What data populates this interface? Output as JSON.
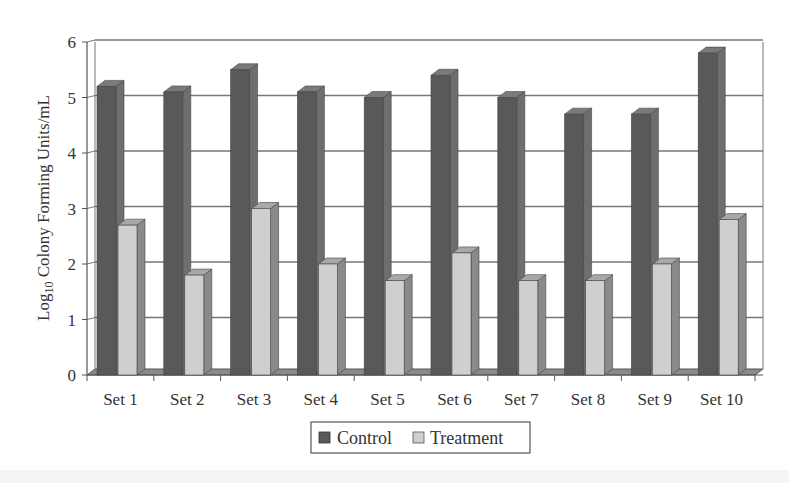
{
  "chart_data": {
    "type": "bar",
    "style": "3d-clustered-column",
    "title": "",
    "xlabel": "",
    "ylabel": "Log10 Colony Forming Units/mL",
    "ylabel_parts": {
      "pre": "Log",
      "sub": "10",
      "post": " Colony Forming Units/mL"
    },
    "ylim": [
      0,
      6
    ],
    "yticks": [
      0,
      1,
      2,
      3,
      4,
      5,
      6
    ],
    "grid": true,
    "legend_position": "bottom",
    "categories": [
      "Set 1",
      "Set 2",
      "Set 3",
      "Set 4",
      "Set 5",
      "Set 6",
      "Set 7",
      "Set 8",
      "Set 9",
      "Set 10"
    ],
    "series": [
      {
        "name": "Control",
        "color": "#595959",
        "side_color": "#6e6e6e",
        "top_color": "#7a7a7a",
        "values": [
          5.2,
          5.1,
          5.5,
          5.1,
          5.0,
          5.4,
          5.0,
          4.7,
          4.7,
          5.8
        ]
      },
      {
        "name": "Treatment",
        "color": "#cfcfcf",
        "side_color": "#8a8a8a",
        "top_color": "#a8a8a8",
        "values": [
          2.7,
          1.8,
          3.0,
          2.0,
          1.7,
          2.2,
          1.7,
          1.7,
          2.0,
          2.8
        ]
      }
    ]
  },
  "legend": {
    "items": [
      {
        "label": "Control",
        "color": "#595959"
      },
      {
        "label": "Treatment",
        "color": "#cfcfcf"
      }
    ]
  }
}
